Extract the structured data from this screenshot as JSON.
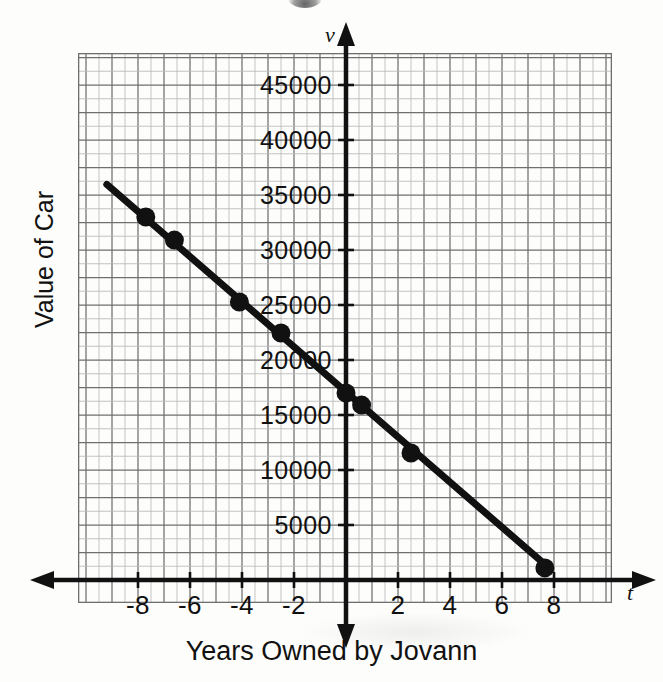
{
  "figure": {
    "x_axis_title": "Years Owned by Jovann",
    "y_axis_title": "Value of Car",
    "x_var_symbol": "t",
    "y_var_symbol": "v"
  },
  "chart_data": {
    "type": "line",
    "title": "",
    "xlabel": "Years Owned by Jovann",
    "ylabel": "Value of Car",
    "x_symbol": "t",
    "y_symbol": "v",
    "xlim": [
      -10.3,
      10.5
    ],
    "ylim": [
      -1000,
      48500
    ],
    "grid": true,
    "grid_minor_step_x": 0.5,
    "grid_minor_step_y": 1250,
    "grid_major_step_x": 1,
    "grid_major_step_y": 2500,
    "xticks": [
      -8,
      -6,
      -4,
      -2,
      2,
      4,
      6,
      8
    ],
    "xtick_labels": [
      "-8",
      "-6",
      "-4",
      "-2",
      "2",
      "4",
      "6",
      "8"
    ],
    "yticks": [
      5000,
      10000,
      15000,
      20000,
      25000,
      30000,
      35000,
      40000,
      45000
    ],
    "ytick_labels": [
      "5000",
      "10000",
      "15000",
      "20000",
      "25000",
      "30000",
      "35000",
      "40000",
      "45000"
    ],
    "series": [
      {
        "name": "Value of Car",
        "marker": "filled-circle",
        "color": "#111111",
        "line_through_points": true,
        "x": [
          -7.7,
          -6.6,
          -4.1,
          -2.5,
          0,
          0.6,
          2.5,
          7.65
        ],
        "y": [
          33000,
          30900,
          25270,
          22450,
          17000,
          15900,
          11550,
          1100
        ],
        "points": [
          {
            "t": -7.7,
            "v": 33000
          },
          {
            "t": -6.6,
            "v": 30900
          },
          {
            "t": -4.1,
            "v": 25270
          },
          {
            "t": -2.5,
            "v": 22450
          },
          {
            "t": 0,
            "v": 17000
          },
          {
            "t": 0.6,
            "v": 15900
          },
          {
            "t": 2.5,
            "v": 11550
          },
          {
            "t": 7.65,
            "v": 1100
          }
        ]
      }
    ],
    "trend_line": {
      "slope": -2050,
      "intercept": 17100,
      "x_start": -9.2,
      "x_end": 7.65
    },
    "legend": null
  }
}
